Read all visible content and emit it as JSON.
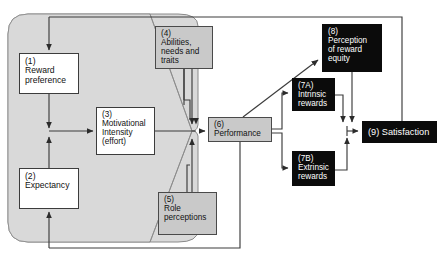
{
  "diagram": {
    "colors": {
      "funnel_fill": "#d9d9d9",
      "funnel_stroke": "#7a7a7a",
      "line": "#3c3c3c",
      "white_box_fill": "#ffffff",
      "gray_box_fill": "#c9c9c9",
      "black_box_fill": "#0b0b0b",
      "black_box_text": "#ffffff",
      "box_text": "#111111"
    },
    "nodes": [
      {
        "id": "1",
        "tag": "(1)",
        "label": "(1)\nReward\npreference",
        "style": "white"
      },
      {
        "id": "2",
        "tag": "(2)",
        "label": "(2)\nExpectancy",
        "style": "white"
      },
      {
        "id": "3",
        "tag": "(3)",
        "label": "(3)\nMotivational\nIntensity\n(effort)",
        "style": "white"
      },
      {
        "id": "4",
        "tag": "(4)",
        "label": "(4)\nAbilities,\nneeds and\ntraits",
        "style": "gray"
      },
      {
        "id": "5",
        "tag": "(5)",
        "label": "(5)\nRole\nperceptions",
        "style": "gray"
      },
      {
        "id": "6",
        "tag": "(6)",
        "label": "(6)\nPerformance",
        "style": "gray"
      },
      {
        "id": "7A",
        "tag": "(7A)",
        "label": "(7A)\nIntrinsic\nrewards",
        "style": "black"
      },
      {
        "id": "7B",
        "tag": "(7B)",
        "label": "(7B)\nExtrinsic\nrewards",
        "style": "black"
      },
      {
        "id": "8",
        "tag": "(8)",
        "label": "(8)\nPerception\nof reward\nequity",
        "style": "black"
      },
      {
        "id": "9",
        "tag": "(9)",
        "label": "(9) Satisfaction",
        "style": "black"
      }
    ]
  }
}
